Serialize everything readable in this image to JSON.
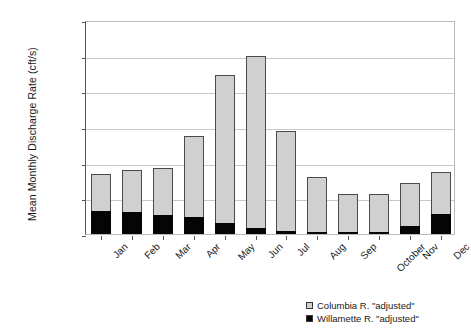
{
  "chart_data": {
    "type": "bar",
    "subtype": "stacked-column",
    "title": "",
    "xlabel": "",
    "ylabel": "Mean Monthly Discharge Rate (cft/s)",
    "ylim": [
      0,
      600000
    ],
    "ytick_step": 100000,
    "ytick_labels": [
      "600,000",
      "500,000",
      "400,000",
      "300,000",
      "200,000",
      "100,000",
      "0"
    ],
    "ytick_values": [
      600000,
      500000,
      400000,
      300000,
      200000,
      100000,
      0
    ],
    "grid": "horizontal",
    "legend_position": "bottom-right",
    "categories": [
      "Jan",
      "Feb",
      "Mar",
      "Apr",
      "May",
      "Jun",
      "Jul",
      "Aug",
      "Sep",
      "October",
      "Nov",
      "Dec"
    ],
    "series": [
      {
        "name": "Willamette R. \"adjusted\"",
        "color": "#050505",
        "values": [
          65000,
          63000,
          52000,
          48000,
          30000,
          17000,
          9000,
          6000,
          5000,
          7000,
          22000,
          57000
        ]
      },
      {
        "name": "Columbia R. \"adjusted\"",
        "color": "#d0d0d0",
        "values": [
          103000,
          117000,
          133000,
          228000,
          415000,
          482000,
          280000,
          154000,
          107000,
          104000,
          121000,
          116000
        ]
      }
    ],
    "totals": [
      168000,
      180000,
      185000,
      276000,
      445000,
      499000,
      289000,
      160000,
      112000,
      111000,
      143000,
      173000
    ]
  },
  "legend": {
    "items": [
      {
        "label": "Columbia R. \"adjusted\"",
        "swatch": "light-gray"
      },
      {
        "label": "Willamette R. \"adjusted\"",
        "swatch": "black"
      }
    ]
  }
}
